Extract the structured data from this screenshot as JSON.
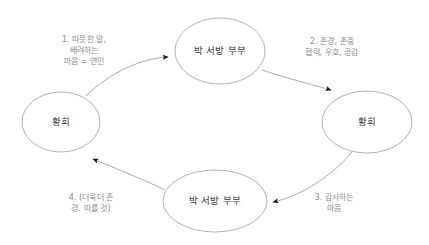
{
  "diagram": {
    "background_color": "#ffffff",
    "node_stroke_color": "#a9a9a9",
    "node_text_color": "#3b3b3b",
    "edge_stroke_color": "#a0a0a0",
    "arrow_color": "#1a1a1a",
    "edge_text_color": "#8c8c8c",
    "nodes": [
      {
        "id": "top",
        "label": "박 서방 부부",
        "cx": 220,
        "cy": 51,
        "rx": 45,
        "ry": 33
      },
      {
        "id": "right",
        "label": "황희",
        "cx": 367,
        "cy": 122,
        "rx": 45,
        "ry": 31
      },
      {
        "id": "bottom",
        "label": "박 서방 부부",
        "cx": 215,
        "cy": 201,
        "rx": 52,
        "ry": 31
      },
      {
        "id": "left",
        "label": "황희",
        "cx": 61,
        "cy": 122,
        "rx": 39,
        "ry": 30
      }
    ],
    "edges": [
      {
        "id": "left-to-top",
        "from": "left",
        "to": "top",
        "label_lines": [
          "1. 따뜻한 말,",
          "배려하는",
          "마음 = 연민"
        ],
        "label_x": 84,
        "label_y": 50
      },
      {
        "id": "top-to-right",
        "from": "top",
        "to": "right",
        "label_lines": [
          "2. 존경, 존중",
          "협력, 우호, 공감"
        ],
        "label_x": 332,
        "label_y": 47
      },
      {
        "id": "right-to-bottom",
        "from": "right",
        "to": "bottom",
        "label_lines": [
          "3. 감사하는",
          "마음"
        ],
        "label_x": 334,
        "label_y": 203
      },
      {
        "id": "bottom-to-left",
        "from": "bottom",
        "to": "left",
        "label_lines": [
          "4. (더욱더 존",
          "경. 따를 것)"
        ],
        "label_x": 91,
        "label_y": 203
      }
    ]
  }
}
